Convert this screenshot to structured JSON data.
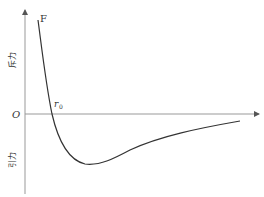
{
  "diagram": {
    "curve_label": "F",
    "origin_label": "O",
    "equilibrium_label": "r",
    "equilibrium_subscript": "0",
    "repulsion_label": "斥力",
    "attraction_label": "引力",
    "colors": {
      "axis": "#999999",
      "curve": "#333333",
      "text": "#333333"
    }
  }
}
